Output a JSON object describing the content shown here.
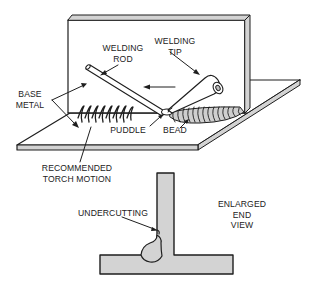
{
  "figure": {
    "type": "technical-illustration"
  },
  "labels": {
    "welding_rod": [
      "WELDING",
      "ROD"
    ],
    "welding_tip": [
      "WELDING",
      "TIP"
    ],
    "base_metal": [
      "BASE",
      "METAL"
    ],
    "puddle": [
      "PUDDLE"
    ],
    "bead": [
      "BEAD"
    ],
    "torch_motion": [
      "RECOMMENDED",
      "TORCH MOTION"
    ],
    "undercutting": [
      "UNDERCUTTING"
    ],
    "end_view": [
      "ENLARGED",
      "END",
      "VIEW"
    ]
  },
  "colors": {
    "ink": "#1e1e1e",
    "metal_fill": "#d3d3d3",
    "paper": "#ffffff"
  }
}
